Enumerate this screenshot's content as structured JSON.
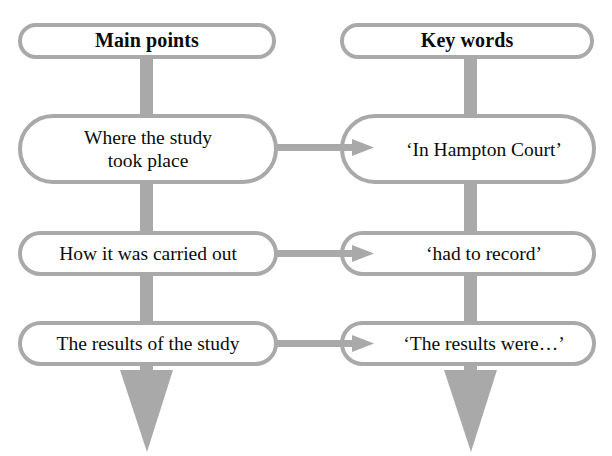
{
  "diagram": {
    "type": "two-column-flow",
    "title_visible": false,
    "colors": {
      "connector": "#a9a9a9",
      "box_border": "#a9a9a9",
      "box_fill": "#ffffff",
      "text": "#0b0b0b",
      "background": "#ffffff"
    },
    "columns": [
      {
        "id": "main-points",
        "header": "Main points",
        "items": [
          "Where the study\ntook place",
          "How it was carried out",
          "The results of the study"
        ]
      },
      {
        "id": "key-words",
        "header": "Key words",
        "items": [
          "‘In Hampton Court’",
          "‘had to record’",
          "‘The results were…’"
        ]
      }
    ],
    "connections": [
      {
        "from": "Where the study took place",
        "to": "‘In Hampton Court’",
        "style": "arrow-right"
      },
      {
        "from": "How it was carried out",
        "to": "‘had to record’",
        "style": "arrow-right"
      },
      {
        "from": "The results of the study",
        "to": "‘The results were…’",
        "style": "arrow-right"
      }
    ],
    "flow_arrows": [
      {
        "column": "main-points",
        "direction": "down",
        "terminal": true
      },
      {
        "column": "key-words",
        "direction": "down",
        "terminal": true
      }
    ]
  },
  "nodes": {
    "left_header": "Main points",
    "right_header": "Key words",
    "left_1_line1": "Where the study",
    "left_1_line2": "took place",
    "left_2": "How it was carried out",
    "left_3": "The results of the study",
    "right_1": "‘In Hampton Court’",
    "right_2": "‘had to record’",
    "right_3": "‘The results were…’"
  }
}
